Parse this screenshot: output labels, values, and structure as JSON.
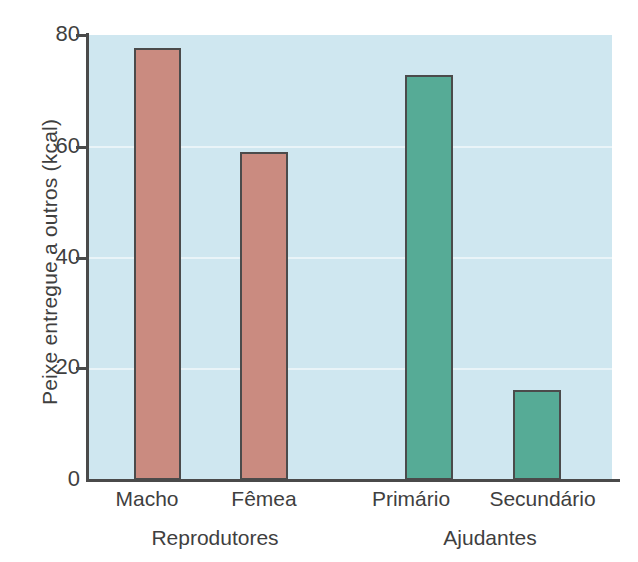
{
  "chart_data": {
    "type": "bar",
    "title": "",
    "subtitle": "",
    "xlabel": "",
    "ylabel": "Peixe entregue a outros (kcal)",
    "categories": [
      "Macho",
      "Fêmea",
      "Primário",
      "Secundário"
    ],
    "values": [
      77.7,
      59.0,
      72.8,
      16.2
    ],
    "groups": [
      {
        "label": "Reprodutores",
        "categories": [
          "Macho",
          "Fêmea"
        ],
        "color": "#ca8b80"
      },
      {
        "label": "Ajudantes",
        "categories": [
          "Primário",
          "Secundário"
        ],
        "color": "#56ab96"
      }
    ],
    "bar_colors": [
      "#ca8b80",
      "#ca8b80",
      "#56ab96",
      "#56ab96"
    ],
    "ylim": [
      0,
      80
    ],
    "yticks": [
      0,
      20,
      40,
      60,
      80
    ],
    "ytick_labels": [
      "0",
      "20",
      "40",
      "60",
      "80"
    ],
    "xlim_categories": 4,
    "grid": true,
    "grid_axis": "y",
    "legend": "none",
    "plot_background_color": "#cfe7f0",
    "axis_color": "#4a4a4a",
    "bar_edge_color": "#4b4b4b"
  },
  "axis": {
    "y_title": "Peixe entregue a outros (kcal)",
    "ticks": [
      {
        "label": "80",
        "value": 80
      },
      {
        "label": "60",
        "value": 60
      },
      {
        "label": "40",
        "value": 40
      },
      {
        "label": "20",
        "value": 20
      },
      {
        "label": "0",
        "value": 0
      }
    ]
  },
  "bars": [
    {
      "name": "Macho",
      "label": "Macho",
      "value": 77.7,
      "color": "#ca8b80"
    },
    {
      "name": "Femea",
      "label": "Fêmea",
      "value": 59.0,
      "color": "#ca8b80"
    },
    {
      "name": "Primario",
      "label": "Primário",
      "value": 72.8,
      "color": "#56ab96"
    },
    {
      "name": "Secundario",
      "label": "Secundário",
      "value": 16.2,
      "color": "#56ab96"
    }
  ],
  "group_labels": [
    {
      "label": "Reprodutores"
    },
    {
      "label": "Ajudantes"
    }
  ]
}
